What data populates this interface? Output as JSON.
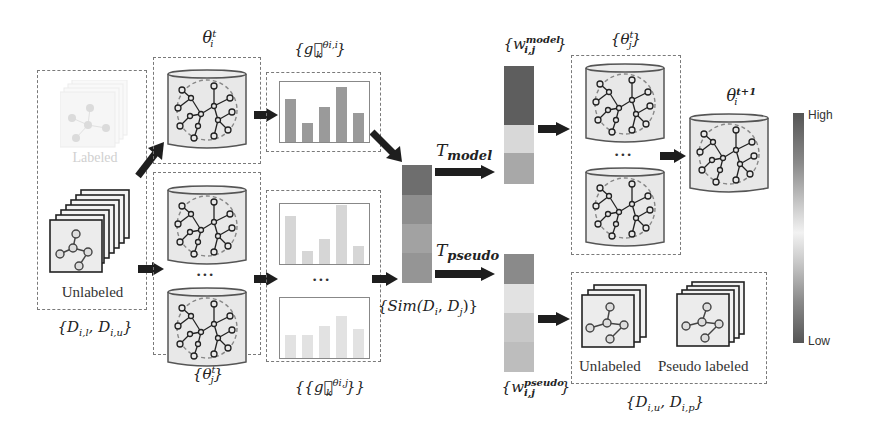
{
  "labels": {
    "theta_i_t": {
      "base": "θ",
      "sup": "t",
      "sub": "i"
    },
    "theta_j_set_bottom": {
      "open": "{",
      "base": "θ",
      "sup": "t",
      "sub": "j",
      "close": "}"
    },
    "theta_j_set_right": {
      "open": "{",
      "base": "θ",
      "sup": "t",
      "sub": "j",
      "close": "}"
    },
    "theta_i_next": {
      "base": "θ",
      "sup": "t+1",
      "sub": "i"
    },
    "grad_i": {
      "open": "{",
      "base": "g⃗",
      "sup": "θi,i",
      "sub": "k",
      "close": "}"
    },
    "grad_j": {
      "open": "{{",
      "base": "g⃗",
      "sup": "θi,j",
      "sub": "k",
      "close": "}}"
    },
    "sim": "{Sim(Di, Dj)}",
    "sim_parts": {
      "open": "{Sim(",
      "d1": "D",
      "s1": "i",
      "sep": ", ",
      "d2": "D",
      "s2": "j",
      "close": ")}"
    },
    "t_model": {
      "base": "T",
      "sub": "model"
    },
    "t_pseudo": {
      "base": "T",
      "sub": "pseudo"
    },
    "w_model": {
      "open": "{",
      "base": "w",
      "sup": "model",
      "sub": "i,j",
      "close": "}"
    },
    "w_pseudo": {
      "open": "{",
      "base": "w",
      "sup": "pseudo",
      "sub": "i,j",
      "close": "}"
    },
    "d_input": {
      "open": "{",
      "a": "D",
      "as": "i,l",
      "sep": ", ",
      "b": "D",
      "bs": "i,u",
      "close": "}"
    },
    "d_output": {
      "open": "{",
      "a": "D",
      "as": "i,u",
      "sep": ", ",
      "b": "D",
      "bs": "i,p",
      "close": "}"
    },
    "labeled": "Labeled",
    "unlabeled_left": "Unlabeled",
    "unlabeled_right": "Unlabeled",
    "pseudo_labeled": "Pseudo labeled",
    "ellipsis": "•••",
    "colorbar_high": "High",
    "colorbar_low": "Low"
  },
  "bars": {
    "top": {
      "values": [
        0.72,
        0.32,
        0.58,
        0.92,
        0.48
      ],
      "color": "#9a9a9a"
    },
    "middle": {
      "values": [
        0.8,
        0.22,
        0.42,
        0.98,
        0.3
      ],
      "color": "#d6d6d6"
    },
    "bottom": {
      "values": [
        0.38,
        0.38,
        0.54,
        0.7,
        0.48
      ],
      "color": "#e2e2e2"
    }
  },
  "heatmaps": {
    "sim": [
      "#6e6e6e",
      "#8e8e8e",
      "#a2a2a2",
      "#959595"
    ],
    "w_model": [
      "#5e5e5e",
      "#d8d8d8",
      "#a8a8a8"
    ],
    "w_pseudo": [
      "#8a8a8a",
      "#e2e2e2",
      "#c8c8c8",
      "#bdbdbd"
    ]
  },
  "colors": {
    "arrow": "#1e1e1e",
    "dashed_border": "#7a7a7a",
    "cylinder_fill": "#e8e8e8",
    "colorbar_stops": [
      "#555555",
      "#9a9a9a",
      "#f2f2f2",
      "#9a9a9a",
      "#555555"
    ]
  }
}
